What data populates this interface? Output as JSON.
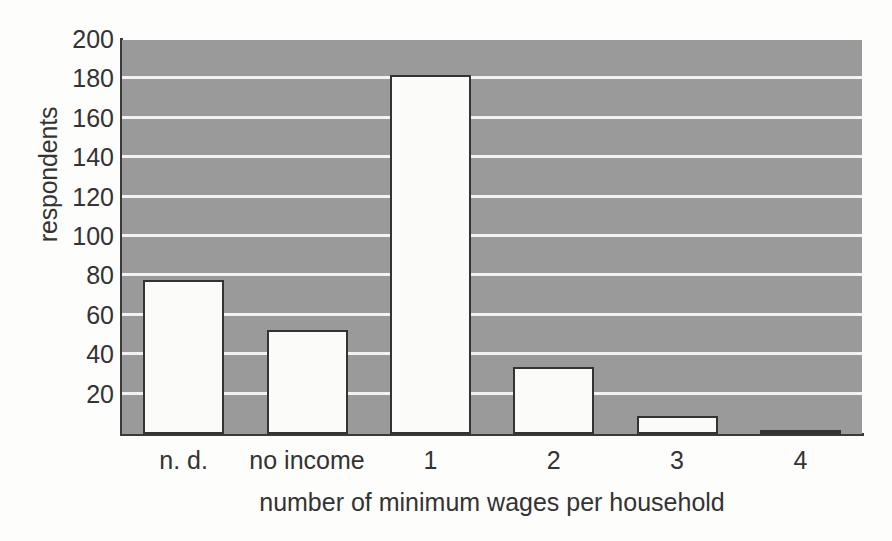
{
  "chart_data": {
    "type": "bar",
    "title": "",
    "subtitle": "",
    "xlabel": "number of minimum wages per household",
    "ylabel": "respondents",
    "categories": [
      "n. d.",
      "no income",
      "1",
      "2",
      "3",
      "4"
    ],
    "values": [
      78,
      53,
      182,
      34,
      9,
      2
    ],
    "series": [
      {
        "name": "respondents",
        "values": [
          78,
          53,
          182,
          34,
          9,
          2
        ]
      }
    ],
    "ylim": [
      0,
      200
    ],
    "ytick_values": [
      20,
      40,
      60,
      80,
      100,
      120,
      140,
      160,
      180,
      200
    ],
    "ytick_labels": [
      "20",
      "40",
      "60",
      "80",
      "100",
      "120",
      "140",
      "160",
      "180",
      "200"
    ],
    "grid": "horizontal",
    "gridline_values": [
      20,
      40,
      60,
      80,
      100,
      120,
      140,
      160,
      180
    ],
    "legend": null,
    "legend_position": "none",
    "annotations": [],
    "colors": {
      "plot_background": "#9a9a9a",
      "gridline": "#f2f2f2",
      "bar_fill": "#fbfbfa",
      "bar_edge": "#333333",
      "axis": "#3a3a3a",
      "text": "#333333",
      "figure_background": "#fdfdfc"
    }
  }
}
